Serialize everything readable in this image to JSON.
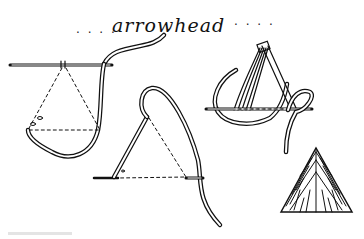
{
  "title": {
    "text": "arrowhead",
    "dots_left": ". . . .",
    "dots_right": ". . . ."
  },
  "figures": [
    {
      "id": "step-1",
      "description": "needle inserted horizontally, thread loops below, dashed triangle guide"
    },
    {
      "id": "step-2",
      "description": "diagonal stitch with needle emerging at bottom, dashed triangle guide"
    },
    {
      "id": "step-3",
      "description": "multiple stitches converge at apex, thread loops around needle"
    },
    {
      "id": "result",
      "description": "finished arrowhead stitch block, triangular filled shape"
    }
  ],
  "colors": {
    "ink": "#111111",
    "background": "#ffffff"
  }
}
